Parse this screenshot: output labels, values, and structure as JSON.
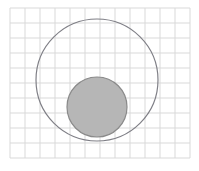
{
  "figure": {
    "width": 199,
    "height": 171,
    "background_color": "#ffffff",
    "title": ""
  },
  "grid": {
    "visible": true,
    "line_color": "#d9d9d9",
    "line_width": 1,
    "spacing": 15,
    "x_start": 10,
    "x_end": 190,
    "y_start": 8,
    "y_end": 158,
    "columns": 12,
    "rows": 10,
    "x_lines": [
      10,
      25,
      40,
      55,
      70,
      85,
      100,
      115,
      130,
      145,
      160,
      175,
      190
    ],
    "y_lines": [
      8,
      23,
      38,
      53,
      68,
      83,
      98,
      113,
      128,
      143,
      158
    ]
  },
  "chart_data": {
    "type": "scatter",
    "title": "",
    "xlabel": "",
    "ylabel": "",
    "grid": true,
    "legend": "none",
    "xlim": [
      10,
      190
    ],
    "ylim": [
      8,
      158
    ],
    "shapes": [
      {
        "name": "large-circle",
        "shape": "circle",
        "cx": 97,
        "cy": 80,
        "r": 61,
        "fill": "none",
        "stroke": "#7f7f86",
        "stroke_width": 1.2,
        "label": "outer circle"
      },
      {
        "name": "small-circle",
        "shape": "circle",
        "cx": 97,
        "cy": 107,
        "r": 30,
        "fill": "#b6b6b6",
        "stroke": "#8a8a8a",
        "stroke_width": 1.2,
        "label": "inner shaded circle"
      }
    ],
    "annotations": []
  },
  "colors": {
    "grid_line": "#d9d9d9",
    "outer_stroke": "#7f7f86",
    "inner_fill": "#b6b6b6",
    "inner_stroke": "#8a8a8a",
    "background": "#ffffff"
  }
}
